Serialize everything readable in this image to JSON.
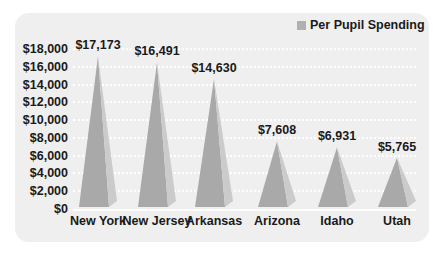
{
  "chart_data": {
    "type": "bar",
    "subtype": "3d-pyramid",
    "title": "",
    "xlabel": "",
    "ylabel": "",
    "categories": [
      "New York",
      "New Jersey",
      "Arkansas",
      "Arizona",
      "Idaho",
      "Utah"
    ],
    "series": [
      {
        "name": "Per Pupil Spending",
        "values": [
          17173,
          16491,
          14630,
          7608,
          6931,
          5765
        ]
      }
    ],
    "value_labels": [
      "$17,173",
      "$16,491",
      "$14,630",
      "$7,608",
      "$6,931",
      "$5,765"
    ],
    "yticks": [
      "$0",
      "$2,000",
      "$4,000",
      "$6,000",
      "$8,000",
      "$10,000",
      "$12,000",
      "$14,000",
      "$16,000",
      "$18,000"
    ],
    "ylim": [
      0,
      18000
    ],
    "grid": true,
    "legend_position": "top-right",
    "colors": {
      "face_dark": "#a9a9a9",
      "face_light": "#cbcbcb",
      "background": "#efefef"
    }
  },
  "legend": {
    "label": "Per Pupil Spending"
  }
}
